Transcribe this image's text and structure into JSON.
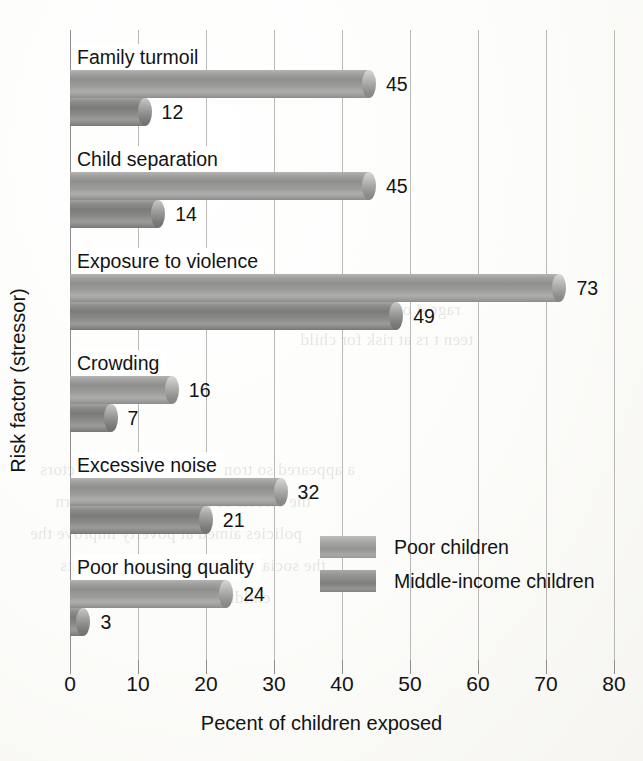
{
  "chart_data": {
    "type": "bar",
    "orientation": "horizontal",
    "title": "",
    "xlabel": "Pecent of children exposed",
    "ylabel": "Risk factor (stressor)",
    "xlim": [
      0,
      80
    ],
    "xticks": [
      0,
      10,
      20,
      30,
      40,
      50,
      60,
      70,
      80
    ],
    "xtick_labels": [
      "0",
      "10",
      "20",
      "30",
      "40",
      "50",
      "60",
      "70",
      "80"
    ],
    "grid": true,
    "legend_position": "inside-lower-right",
    "categories": [
      "Family turmoil",
      "Child separation",
      "Exposure to violence",
      "Crowding",
      "Excessive noise",
      "Poor housing quality"
    ],
    "series": [
      {
        "name": "Poor children",
        "color": "#9a9a98",
        "values": [
          45,
          45,
          73,
          16,
          32,
          24
        ],
        "value_labels": [
          "45",
          "45",
          "73",
          "16",
          "32",
          "24"
        ]
      },
      {
        "name": "Middle-income children",
        "color": "#848482",
        "values": [
          12,
          14,
          49,
          7,
          21,
          3
        ],
        "value_labels": [
          "12",
          "14",
          "49",
          "7",
          "21",
          "3"
        ]
      }
    ]
  },
  "legend": {
    "entries": [
      {
        "label": "Poor children",
        "series_index": 0
      },
      {
        "label": "Middle-income children",
        "series_index": 1
      }
    ]
  },
  "bleed_through": {
    "note": "faint mirrored text showing through from the reverse page",
    "lines": [
      "rage 4 over 1971 .",
      "teen t     rs at risk for child",
      "a appeared   so trongly said other risk factors",
      "the effects of poverty. Thus, govern",
      "policies aimed at poverty improve the",
      "the social and physical environments",
      "children live. (Evans, 2004)"
    ]
  }
}
